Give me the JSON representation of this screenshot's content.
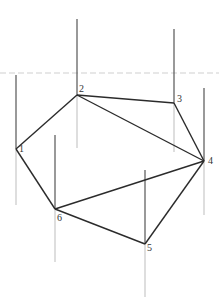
{
  "diagram": {
    "type": "graph",
    "directed": false,
    "horizontal_guide": {
      "y": 73,
      "x1": 0,
      "x2": 219,
      "color": "#e6e6e6"
    },
    "nodes": [
      {
        "id": "1",
        "label": "1",
        "x": 16,
        "y": 149,
        "stem_top": 75,
        "stem_bottom": 205,
        "label_dx": 3,
        "label_dy": 3
      },
      {
        "id": "2",
        "label": "2",
        "x": 77,
        "y": 95,
        "stem_top": 19,
        "stem_bottom": 148,
        "label_dx": 2,
        "label_dy": -3
      },
      {
        "id": "3",
        "label": "3",
        "x": 174,
        "y": 103,
        "stem_top": 29,
        "stem_bottom": 152,
        "label_dx": 3,
        "label_dy": -1
      },
      {
        "id": "4",
        "label": "4",
        "x": 204,
        "y": 161,
        "stem_top": 88,
        "stem_bottom": 215,
        "label_dx": 4,
        "label_dy": 3
      },
      {
        "id": "5",
        "label": "5",
        "x": 145,
        "y": 244,
        "stem_top": 170,
        "stem_bottom": 297,
        "label_dx": 2,
        "label_dy": 7
      },
      {
        "id": "6",
        "label": "6",
        "x": 55,
        "y": 209,
        "stem_top": 135,
        "stem_bottom": 262,
        "label_dx": 2,
        "label_dy": 12
      }
    ],
    "edges": [
      {
        "from": "1",
        "to": "2"
      },
      {
        "from": "2",
        "to": "3"
      },
      {
        "from": "2",
        "to": "4"
      },
      {
        "from": "3",
        "to": "4"
      },
      {
        "from": "4",
        "to": "6"
      },
      {
        "from": "4",
        "to": "5"
      },
      {
        "from": "5",
        "to": "6"
      },
      {
        "from": "6",
        "to": "1"
      }
    ],
    "colors": {
      "edge": "#2b2b2b",
      "stem_up": "#555555",
      "stem_down": "#bdbdbd",
      "background": "#ffffff"
    }
  }
}
